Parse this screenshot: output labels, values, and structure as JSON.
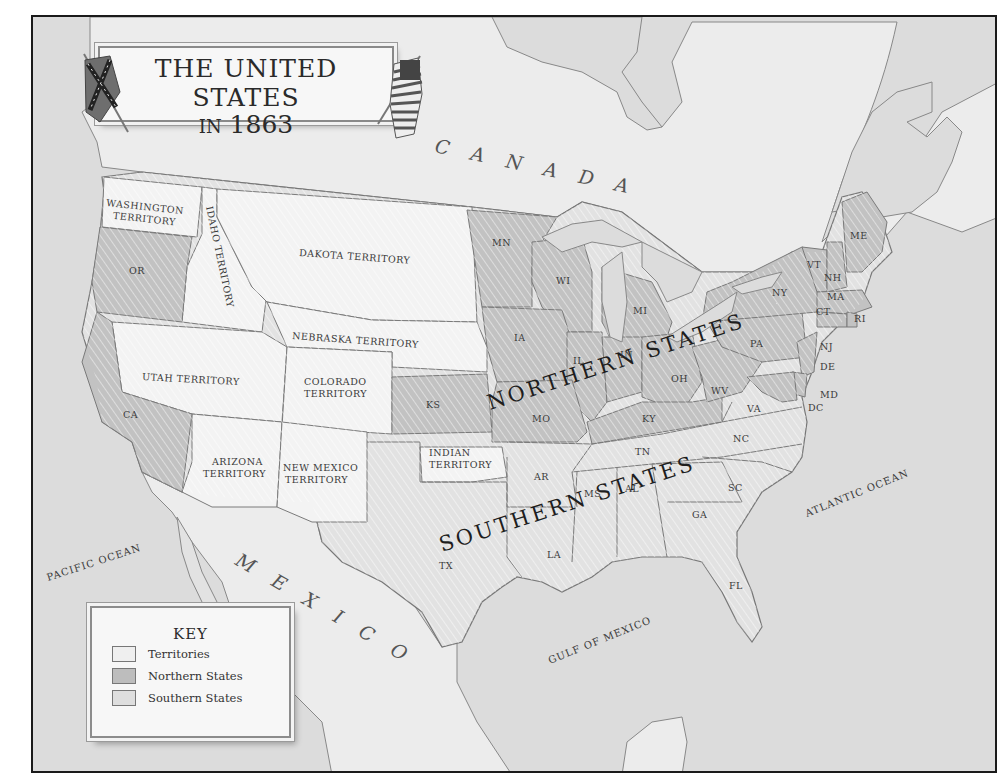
{
  "title": {
    "line1": "THE UNITED STATES",
    "line2_prefix": "IN",
    "line2_year": "1863"
  },
  "countries": {
    "canada": "CANADA",
    "mexico": "MEXICO"
  },
  "oceans": {
    "pacific": "PACIFIC OCEAN",
    "atlantic": "ATLANTIC OCEAN",
    "gulf": "GULF OF MEXICO"
  },
  "regions": {
    "northern": "NORTHERN STATES",
    "southern": "SOUTHERN STATES"
  },
  "territories": {
    "washington": [
      "WASHINGTON",
      "TERRITORY"
    ],
    "idaho": "IDAHO TERRITORY",
    "dakota": "DAKOTA TERRITORY",
    "nebraska": "NEBRASKA TERRITORY",
    "utah": "UTAH TERRITORY",
    "colorado": [
      "COLORADO",
      "TERRITORY"
    ],
    "arizona": [
      "ARIZONA",
      "TERRITORY"
    ],
    "new_mexico": [
      "NEW MEXICO",
      "TERRITORY"
    ],
    "indian": [
      "INDIAN",
      "TERRITORY"
    ]
  },
  "northern_states": [
    "OR",
    "CA",
    "KS",
    "MN",
    "WI",
    "IA",
    "MI",
    "IL",
    "IN",
    "OH",
    "MO",
    "KY",
    "WV",
    "PA",
    "NY",
    "VT",
    "NH",
    "ME",
    "MA",
    "CT",
    "RI",
    "NJ",
    "DE",
    "MD",
    "DC"
  ],
  "southern_states": [
    "TX",
    "AR",
    "LA",
    "MS",
    "AL",
    "TN",
    "GA",
    "SC",
    "NC",
    "VA",
    "FL"
  ],
  "key": {
    "title": "KEY",
    "items": [
      {
        "label": "Territories",
        "color": "#efefef"
      },
      {
        "label": "Northern States",
        "color": "#bdbdbd"
      },
      {
        "label": "Southern States",
        "color": "#dedede"
      }
    ]
  },
  "colors": {
    "frame": "#1a1a1a",
    "water": "#dcdcdc",
    "foreign_land": "#ebebeb",
    "territory": "#f3f3f3",
    "northern": "#c2c2c2",
    "southern": "#e2e2e2",
    "border": "#7a7a7a"
  }
}
